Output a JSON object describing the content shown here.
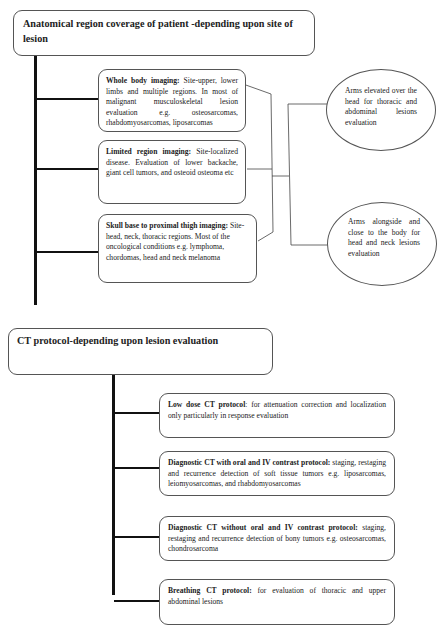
{
  "section1": {
    "title": "Anatomical region coverage of patient -depending upon site of lesion",
    "items": [
      {
        "bold": "Whole body imaging:",
        "text": " Site-upper, lower limbs and multiple regions. In most of malignant musculoskeletal lesion evaluation e.g. osteosarcomas, rhabdomyosarcomas, liposarcomas"
      },
      {
        "bold": "Limited region imaging:",
        "text": " Site-localized disease. Evaluation of lower backache, giant cell tumors, and osteoid osteoma etc"
      },
      {
        "bold": "Skull base to proximal thigh imaging:",
        "text": " Site- head, neck, thoracic regions. Most of the oncological conditions e.g. lymphoma, chordomas, head and neck melanoma"
      }
    ],
    "positions": [
      {
        "text": "Arms elevated over the head for thoracic and abdominal lesions evaluation"
      },
      {
        "text": "Arms alongside and close to the body for head and neck lesions evaluation"
      }
    ]
  },
  "section2": {
    "title": "CT protocol-depending upon lesion evaluation",
    "items": [
      {
        "bold": "Low dose CT protocol",
        "text": ": for attenuation correction and localization only particularly in response evaluation"
      },
      {
        "bold": "Diagnostic CT with oral and IV contrast protocol:",
        "text": " staging, restaging and recurrence detection of soft tissue tumors e.g. liposarcomas, leiomyosarcomas, and rhabdomyosarcomas"
      },
      {
        "bold": "Diagnostic CT without oral and IV contrast protocol:",
        "text": " staging, restaging and recurrence detection of bony tumors e.g. osteosarcomas, chondrosarcoma"
      },
      {
        "bold": "Breathing CT protocol:",
        "text": "  for evaluation of thoracic and upper abdominal lesions"
      }
    ]
  }
}
